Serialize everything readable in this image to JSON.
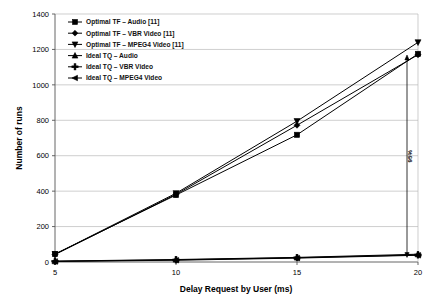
{
  "chart_data": {
    "type": "line",
    "title": "",
    "xlabel": "Delay Request by User (ms)",
    "ylabel": "Number of runs",
    "x": [
      5,
      10,
      15,
      20
    ],
    "xlim": [
      5,
      20
    ],
    "ylim": [
      0,
      1400
    ],
    "xticks": [
      "5",
      "10",
      "15",
      "20"
    ],
    "yticks": [
      "0",
      "200",
      "400",
      "600",
      "800",
      "1000",
      "1200",
      "1400"
    ],
    "grid": "horizontal",
    "legend_position": "top-left",
    "series": [
      {
        "name": "Optimal TF – Audio [11]",
        "marker": "square",
        "values": [
          45,
          378,
          718,
          1175
        ]
      },
      {
        "name": "Optimal TF – VBR Video [11]",
        "marker": "diamond",
        "values": [
          42,
          382,
          772,
          1170
        ]
      },
      {
        "name": "Optimal TF – MPEG4 Video [11]",
        "marker": "triangle-down",
        "values": [
          44,
          388,
          795,
          1240
        ]
      },
      {
        "name": "Ideal TQ – Audio",
        "marker": "triangle-up",
        "values": [
          5,
          14,
          26,
          44
        ]
      },
      {
        "name": "Ideal TQ – VBR Video",
        "marker": "plus",
        "values": [
          4,
          12,
          24,
          40
        ]
      },
      {
        "name": "Ideal TQ – MPEG4 Video",
        "marker": "triangle-left",
        "values": [
          3,
          10,
          22,
          38
        ]
      }
    ],
    "annotations": [
      {
        "text": "95%",
        "x": 20,
        "y_from": 44,
        "y_to": 1150,
        "orientation": "vertical"
      }
    ]
  },
  "legend": {
    "items": [
      {
        "label": "Optimal TF – Audio [11]",
        "marker": "square-marker-icon"
      },
      {
        "label": "Optimal TF – VBR Video [11]",
        "marker": "diamond-marker-icon"
      },
      {
        "label": "Optimal TF – MPEG4 Video [11]",
        "marker": "triangle-down-marker-icon"
      },
      {
        "label": "Ideal TQ – Audio",
        "marker": "triangle-up-marker-icon"
      },
      {
        "label": "Ideal TQ – VBR Video",
        "marker": "plus-marker-icon"
      },
      {
        "label": "Ideal TQ – MPEG4 Video",
        "marker": "triangle-left-marker-icon"
      }
    ]
  },
  "colors": {
    "series": "#000000",
    "grid": "#b9b9b9",
    "axis": "#555555",
    "background": "#ffffff"
  }
}
